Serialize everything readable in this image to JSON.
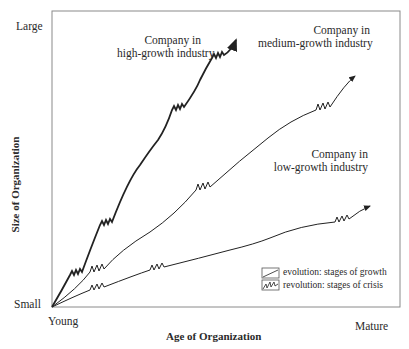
{
  "axes": {
    "y_label": "Size of Organization",
    "x_label": "Age of Organization",
    "y_ticks": [
      "Large",
      "Small"
    ],
    "x_ticks": [
      "Young",
      "Mature"
    ]
  },
  "curves": [
    {
      "id": "high",
      "label_line1": "Company in",
      "label_line2": "high-growth industry",
      "stroke_weight": "thick"
    },
    {
      "id": "medium",
      "label_line1": "Company in",
      "label_line2": "medium-growth industry",
      "stroke_weight": "thin"
    },
    {
      "id": "low",
      "label_line1": "Company in",
      "label_line2": "low-growth industry",
      "stroke_weight": "thin"
    }
  ],
  "legend": {
    "items": [
      {
        "icon": "evolution-line-icon",
        "label": "evolution: stages of growth"
      },
      {
        "icon": "revolution-zigzag-icon",
        "label": "revolution: stages of crisis"
      }
    ]
  },
  "colors": {
    "line": "#2b2b2b",
    "frame": "#8a8a8a",
    "text": "#2a2a2a"
  }
}
